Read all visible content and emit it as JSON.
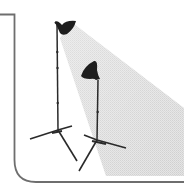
{
  "illustration": {
    "subject": "two studio lights on tripod stands casting a light beam",
    "colors": {
      "frame": "#6e6e6e",
      "stand": "#2a2a2a",
      "lamp_head": "#1e1e1e",
      "beam": "#d9d9d9",
      "background": "#ffffff"
    },
    "icons": [
      "studio-light-icon",
      "studio-light-icon",
      "light-beam-icon",
      "frame-icon"
    ]
  }
}
